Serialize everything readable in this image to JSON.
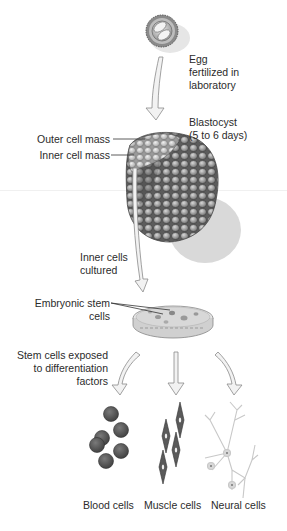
{
  "diagram": {
    "steps": {
      "egg": {
        "label": "Egg fertilized in laboratory",
        "lines": [
          "Egg",
          "fertilized in",
          "laboratory"
        ]
      },
      "blastocyst": {
        "label": "Blastocyst (5 to 6 days)",
        "lines": [
          "Blastocyst",
          "(5 to 6 days)"
        ]
      },
      "outer_cell_mass": {
        "label": "Outer cell mass"
      },
      "inner_cell_mass": {
        "label": "Inner cell mass"
      },
      "inner_cells_cultured": {
        "lines": [
          "Inner cells",
          "cultured"
        ]
      },
      "embryonic_stem_cells": {
        "lines": [
          "Embryonic stem",
          "cells"
        ]
      },
      "exposed": {
        "lines": [
          "Stem cells exposed",
          "to differentiation",
          "factors"
        ]
      }
    },
    "outcomes": [
      {
        "label": "Blood cells"
      },
      {
        "label": "Muscle cells"
      },
      {
        "label": "Neural cells"
      }
    ],
    "colors": {
      "cell_dark": "#5a5a5a",
      "cell_light": "#c8c8c8",
      "arrow_fill": "#f2f2f2",
      "arrow_stroke": "#8a8a8a",
      "shadow": "#d9d9d9",
      "text": "#2b2b2b"
    }
  }
}
